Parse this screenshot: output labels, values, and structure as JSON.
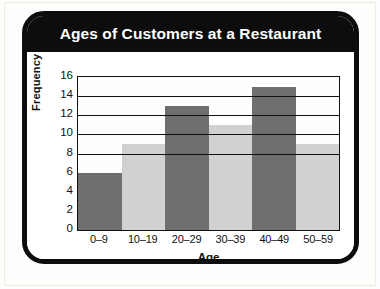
{
  "card": {
    "title": "Ages of Customers at a Restaurant"
  },
  "background_artifacts": {
    "line_1": "",
    "line_2": "",
    "line_3": ""
  },
  "chart_data": {
    "type": "bar",
    "title": "Ages of Customers at a Restaurant",
    "xlabel": "Age",
    "ylabel": "Frequency",
    "categories": [
      "0–9",
      "10–19",
      "20–29",
      "30–39",
      "40–49",
      "50–59"
    ],
    "values": [
      6,
      9,
      13,
      11,
      15,
      9
    ],
    "bar_colors": [
      "#6f6f6f",
      "#d1d1d1",
      "#6f6f6f",
      "#d1d1d1",
      "#6f6f6f",
      "#d1d1d1"
    ],
    "ylim": [
      0,
      16
    ],
    "ytick_labels": [
      "16",
      "14",
      "12",
      "10",
      "8",
      "6",
      "4",
      "2",
      "0"
    ],
    "ytick_values": [
      16,
      14,
      12,
      10,
      8,
      6,
      4,
      2,
      0
    ],
    "gridlines": [
      14,
      12,
      10,
      8
    ],
    "grid": true,
    "legend": "none",
    "bar_gap": 0
  },
  "colors": {
    "frame": "#0d0d0d",
    "banner_text": "#ffffff",
    "bar_dark": "#6f6f6f",
    "bar_light": "#d1d1d1",
    "plot_background": "#fefefe"
  }
}
